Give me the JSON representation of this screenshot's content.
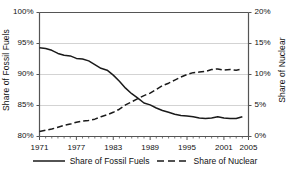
{
  "chart_data": {
    "type": "line",
    "title": "",
    "xlabel": "",
    "ylabel": "Share of Fossil Fuels",
    "ylabel_right": "Share of Nuclear",
    "grid": true,
    "legend_position": "bottom",
    "xlim": [
      1971,
      2005
    ],
    "ylim": [
      80,
      100
    ],
    "ylim_right": [
      0,
      20
    ],
    "xticks": [
      "1971",
      "1977",
      "1983",
      "1989",
      "1995",
      "2001",
      "2005"
    ],
    "xtick_values": [
      1971,
      1977,
      1983,
      1989,
      1995,
      2001,
      2005
    ],
    "yticks_left": [
      "80%",
      "85%",
      "90%",
      "95%",
      "100%"
    ],
    "ytick_values_left": [
      80,
      85,
      90,
      95,
      100
    ],
    "yticks_right": [
      "0%",
      "5%",
      "10%",
      "15%",
      "20%"
    ],
    "ytick_values_right": [
      0,
      5,
      10,
      15,
      20
    ],
    "x": [
      1971,
      1972,
      1973,
      1974,
      1975,
      1976,
      1977,
      1978,
      1979,
      1980,
      1981,
      1982,
      1983,
      1984,
      1985,
      1986,
      1987,
      1988,
      1989,
      1990,
      1991,
      1992,
      1993,
      1994,
      1995,
      1996,
      1997,
      1998,
      1999,
      2000,
      2001,
      2002,
      2003,
      2004
    ],
    "series": [
      {
        "name": "Share of Fossil Fuels",
        "axis": "left",
        "style": "solid",
        "color": "#1a1a1a",
        "values": [
          94.3,
          94.2,
          93.9,
          93.4,
          93.1,
          93.0,
          92.6,
          92.5,
          92.2,
          91.6,
          91.0,
          90.7,
          89.9,
          88.9,
          87.8,
          86.9,
          86.2,
          85.4,
          85.1,
          84.6,
          84.2,
          83.9,
          83.6,
          83.4,
          83.3,
          83.2,
          83.0,
          82.9,
          83.0,
          83.2,
          83.0,
          82.9,
          82.9,
          83.2
        ]
      },
      {
        "name": "Share of Nuclear",
        "axis": "right",
        "style": "dashed",
        "color": "#1a1a1a",
        "values": [
          0.8,
          1.0,
          1.2,
          1.5,
          1.8,
          2.0,
          2.3,
          2.5,
          2.6,
          2.8,
          3.2,
          3.5,
          3.9,
          4.4,
          5.1,
          5.6,
          6.1,
          6.6,
          7.0,
          7.6,
          8.2,
          8.6,
          9.1,
          9.6,
          10.0,
          10.3,
          10.4,
          10.5,
          10.8,
          10.9,
          10.7,
          10.8,
          10.7,
          10.9
        ]
      }
    ],
    "legend": [
      {
        "label": "Share of Fossil Fuels",
        "style": "solid"
      },
      {
        "label": "Share of Nuclear",
        "style": "dashed"
      }
    ],
    "colors": {
      "axis": "#555555",
      "grid": "#c8c8c8",
      "line": "#1a1a1a",
      "text": "#111111",
      "background": "#ffffff"
    }
  }
}
